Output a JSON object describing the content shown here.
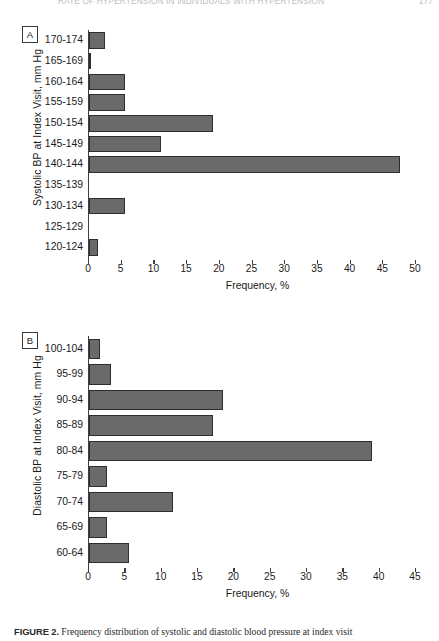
{
  "running_head": {
    "title": "RATE OF HYPERTENSION IN INDIVIDUALS WITH HYPERTENSION",
    "page": "177"
  },
  "figure": {
    "caption_label": "FIGURE 2.",
    "caption_text": "Frequency distribution of systolic and diastolic blood pressure at index visit"
  },
  "panels": [
    {
      "id": "A",
      "letter": "A",
      "ylabel": "Systolic BP at Index Visit, mm Hg",
      "xlabel": "Frequency, %"
    },
    {
      "id": "B",
      "letter": "B",
      "ylabel": "Diastolic BP at Index Visit, mm Hg",
      "xlabel": "Frequency, %"
    }
  ],
  "chart_data": [
    {
      "type": "bar",
      "orientation": "horizontal",
      "panel": "A",
      "title": "",
      "xlabel": "Frequency, %",
      "ylabel": "Systolic BP at Index Visit, mm Hg",
      "xlim": [
        0,
        50
      ],
      "xticks": [
        0,
        5,
        10,
        15,
        20,
        25,
        30,
        35,
        40,
        45,
        50
      ],
      "grid": false,
      "legend": null,
      "bar_color": "#6a6a6a",
      "categories": [
        "170-174",
        "165-169",
        "160-164",
        "155-159",
        "150-154",
        "145-149",
        "140-144",
        "135-139",
        "130-134",
        "125-129",
        "120-124"
      ],
      "values": [
        2.5,
        0.3,
        5.5,
        5.5,
        19.0,
        11.0,
        47.5,
        0.0,
        5.5,
        0.0,
        1.3
      ]
    },
    {
      "type": "bar",
      "orientation": "horizontal",
      "panel": "B",
      "title": "",
      "xlabel": "Frequency, %",
      "ylabel": "Diastolic BP at Index Visit, mm Hg",
      "xlim": [
        0,
        45
      ],
      "xticks": [
        0,
        5,
        10,
        15,
        20,
        25,
        30,
        35,
        40,
        45
      ],
      "grid": false,
      "legend": null,
      "bar_color": "#6a6a6a",
      "categories": [
        "100-104",
        "95-99",
        "90-94",
        "85-89",
        "80-84",
        "75-79",
        "70-74",
        "65-69",
        "60-64"
      ],
      "values": [
        1.5,
        3.0,
        18.5,
        17.0,
        39.0,
        2.5,
        11.5,
        2.5,
        5.5
      ]
    }
  ]
}
